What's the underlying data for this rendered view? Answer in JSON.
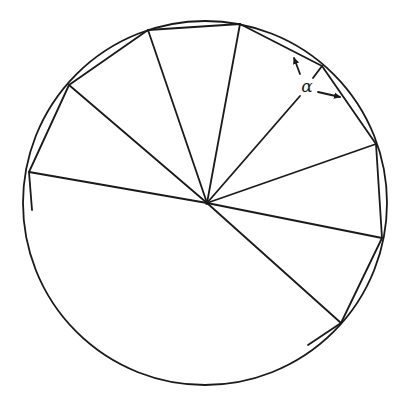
{
  "diagram": {
    "stroke_color": "#1a1a1a",
    "background": "#ffffff",
    "circle": {
      "cx": 205,
      "cy": 203,
      "r": 182
    },
    "hub": {
      "x": 207,
      "y": 203
    },
    "polygon_vertices": [
      {
        "x": 32,
        "y": 210
      },
      {
        "x": 29,
        "y": 172
      },
      {
        "x": 69,
        "y": 85
      },
      {
        "x": 148,
        "y": 30
      },
      {
        "x": 240,
        "y": 24
      },
      {
        "x": 322,
        "y": 66
      },
      {
        "x": 376,
        "y": 144
      },
      {
        "x": 382,
        "y": 238
      },
      {
        "x": 341,
        "y": 323
      },
      {
        "x": 308,
        "y": 345
      }
    ],
    "spokes": [
      {
        "x1": 207,
        "y1": 203,
        "x2": 29,
        "y2": 172
      },
      {
        "x1": 207,
        "y1": 203,
        "x2": 69,
        "y2": 85
      },
      {
        "x1": 207,
        "y1": 203,
        "x2": 148,
        "y2": 30
      },
      {
        "x1": 207,
        "y1": 203,
        "x2": 240,
        "y2": 24
      },
      {
        "x1": 207,
        "y1": 203,
        "x2": 300,
        "y2": 96
      },
      {
        "x1": 313,
        "y1": 78,
        "x2": 322,
        "y2": 66
      },
      {
        "x1": 207,
        "y1": 203,
        "x2": 376,
        "y2": 144
      },
      {
        "x1": 207,
        "y1": 203,
        "x2": 382,
        "y2": 238
      },
      {
        "x1": 207,
        "y1": 203,
        "x2": 341,
        "y2": 323
      }
    ],
    "angle_arrows": [
      {
        "x1": 300,
        "y1": 74,
        "x2": 294,
        "y2": 58
      },
      {
        "x1": 318,
        "y1": 92,
        "x2": 340,
        "y2": 97
      }
    ],
    "angle_label": {
      "text": "α",
      "x": 307,
      "y": 86
    }
  }
}
